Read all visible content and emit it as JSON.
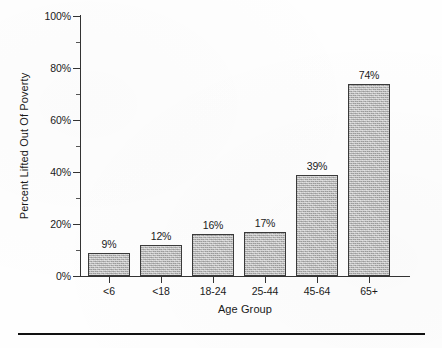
{
  "chart_data": {
    "type": "bar",
    "title": "",
    "subtitle": "",
    "xlabel": "Age Group",
    "ylabel": "Percent Lifted Out Of Poverty",
    "categories": [
      "<6",
      "<18",
      "18-24",
      "25-44",
      "45-64",
      "65+"
    ],
    "values": [
      9,
      12,
      16,
      17,
      39,
      74
    ],
    "value_labels": [
      "9%",
      "12%",
      "16%",
      "17%",
      "39%",
      "74%"
    ],
    "ylim": [
      0,
      100
    ],
    "y_ticks": [
      0,
      20,
      40,
      60,
      80,
      100
    ],
    "y_tick_labels": [
      "0%",
      "20%",
      "40%",
      "60%",
      "80%",
      "100%"
    ],
    "y_minor_ticks": [
      10,
      30,
      50,
      70,
      90
    ],
    "grid": false,
    "legend": null,
    "legend_position": "none",
    "series": [
      {
        "name": "Percent Lifted Out Of Poverty",
        "values": [
          9,
          12,
          16,
          17,
          39,
          74
        ]
      }
    ],
    "bar_fill_color": "#b4b4b4",
    "bar_border_color": "#3a3a3a",
    "axis_color": "#333333",
    "text_color": "#1a1a1a",
    "background_color": "#ffffff"
  },
  "figure": {
    "bottom_rule_color": "#111111"
  }
}
